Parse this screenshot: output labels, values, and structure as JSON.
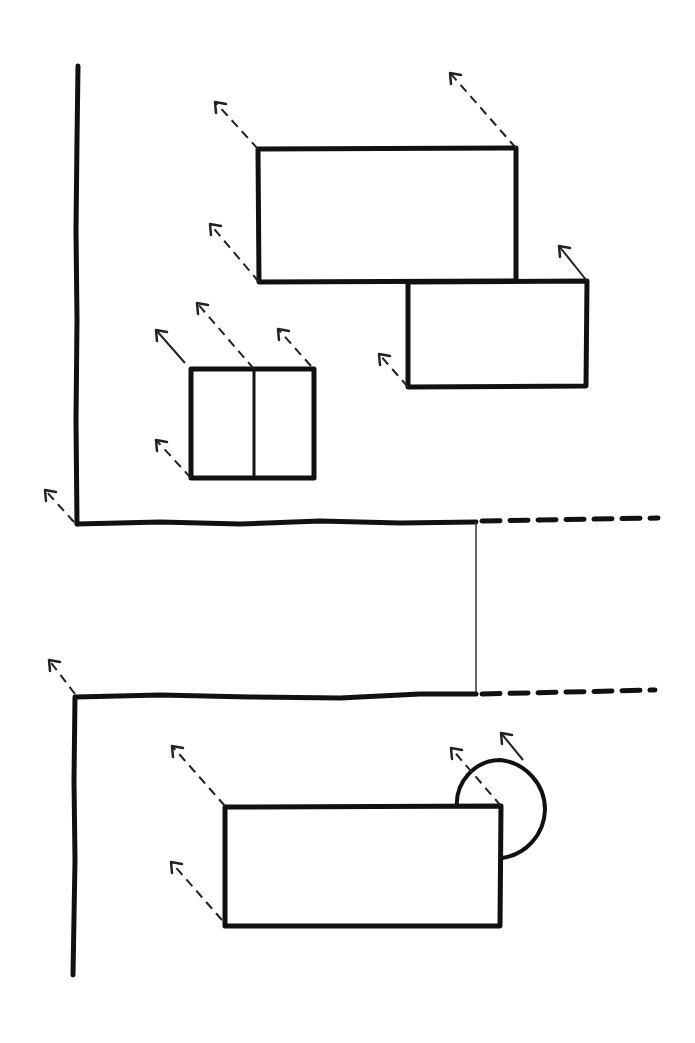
{
  "diagram": {
    "title": "",
    "style": "hand-drawn sketch",
    "stroke_color": "#111111",
    "background": "#ffffff",
    "upper_section": {
      "wall_left": {
        "x": 77,
        "y1": 65,
        "y2": 524
      },
      "wall_bottom": {
        "y": 524,
        "x1": 77,
        "x2": 475,
        "dashed_to": 660
      },
      "rectangles": [
        {
          "id": "large-rect-upper",
          "x": 258,
          "y": 148,
          "w": 258,
          "h": 133
        },
        {
          "id": "rect-right",
          "x": 408,
          "y": 281,
          "w": 178,
          "h": 104
        },
        {
          "id": "double-window",
          "x": 191,
          "y": 369,
          "w": 123,
          "h": 108,
          "divider_x": 254
        }
      ]
    },
    "connector": {
      "x": 476,
      "y1": 524,
      "y2": 694
    },
    "lower_section": {
      "wall_top": {
        "y": 694,
        "x1": 77,
        "x2": 475,
        "dashed_to": 655
      },
      "wall_left": {
        "x": 74,
        "y1": 694,
        "y2": 975
      },
      "rectangles": [
        {
          "id": "lower-rect",
          "x": 225,
          "y": 806,
          "w": 276,
          "h": 120
        }
      ],
      "door_swing": {
        "hinge_x": 501,
        "hinge_y": 806,
        "radius": 48
      }
    },
    "leader_arrows_count": 17
  }
}
